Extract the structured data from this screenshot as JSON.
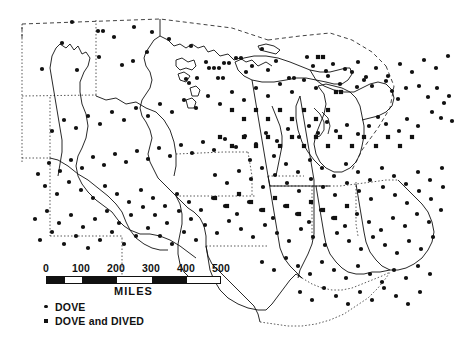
{
  "figure": {
    "background_color": "#ffffff",
    "ink_color": "#111111"
  },
  "scale": {
    "unit_label": "MILES",
    "ticks": [
      "0",
      "100",
      "200",
      "300",
      "400",
      "500"
    ],
    "tick_values": [
      0,
      100,
      200,
      300,
      400,
      500
    ],
    "bar_segments": [
      {
        "from": 0,
        "to": 50,
        "fill": "black"
      },
      {
        "from": 50,
        "to": 100,
        "fill": "white"
      },
      {
        "from": 100,
        "to": 200,
        "fill": "black"
      },
      {
        "from": 200,
        "to": 300,
        "fill": "white"
      },
      {
        "from": 300,
        "to": 400,
        "fill": "black"
      },
      {
        "from": 400,
        "to": 500,
        "fill": "white"
      }
    ]
  },
  "legend": {
    "items": [
      {
        "marker": "circle-marker",
        "label": "DOVE"
      },
      {
        "marker": "square-marker",
        "label": "DOVE and DIVED"
      }
    ]
  },
  "chart_data": {
    "type": "scatter",
    "xlabel": "",
    "ylabel": "",
    "legend_position": "bottom-left",
    "grid": false,
    "series": [
      {
        "name": "DOVE",
        "marker": "circle",
        "color": "#111111",
        "count": 268,
        "points": [
          [
            72,
            22
          ],
          [
            98,
            31
          ],
          [
            103,
            31
          ],
          [
            134,
            27
          ],
          [
            147,
            52
          ],
          [
            114,
            37
          ],
          [
            152,
            32
          ],
          [
            62,
            43
          ],
          [
            42,
            69
          ],
          [
            77,
            70
          ],
          [
            99,
            57
          ],
          [
            122,
            65
          ],
          [
            133,
            61
          ],
          [
            169,
            39
          ],
          [
            191,
            46
          ],
          [
            206,
            62
          ],
          [
            186,
            79
          ],
          [
            189,
            83
          ],
          [
            197,
            78
          ],
          [
            209,
            68
          ],
          [
            214,
            68
          ],
          [
            219,
            68
          ],
          [
            224,
            63
          ],
          [
            229,
            63
          ],
          [
            218,
            78
          ],
          [
            223,
            78
          ],
          [
            236,
            58
          ],
          [
            241,
            58
          ],
          [
            252,
            66
          ],
          [
            246,
            72
          ],
          [
            262,
            49
          ],
          [
            268,
            70
          ],
          [
            276,
            61
          ],
          [
            289,
            78
          ],
          [
            294,
            78
          ],
          [
            307,
            57
          ],
          [
            313,
            66
          ],
          [
            326,
            71
          ],
          [
            333,
            64
          ],
          [
            345,
            69
          ],
          [
            358,
            62
          ],
          [
            366,
            77
          ],
          [
            357,
            87
          ],
          [
            372,
            86
          ],
          [
            386,
            81
          ],
          [
            392,
            91
          ],
          [
            398,
            99
          ],
          [
            406,
            88
          ],
          [
            419,
            86
          ],
          [
            428,
            97
          ],
          [
            437,
            88
          ],
          [
            444,
            103
          ],
          [
            449,
            96
          ],
          [
            432,
            112
          ],
          [
            441,
            118
          ],
          [
            452,
            121
          ],
          [
            418,
            126
          ],
          [
            407,
            119
          ],
          [
            399,
            131
          ],
          [
            386,
            124
          ],
          [
            378,
            117
          ],
          [
            369,
            126
          ],
          [
            358,
            134
          ],
          [
            347,
            125
          ],
          [
            336,
            131
          ],
          [
            327,
            122
          ],
          [
            318,
            133
          ],
          [
            309,
            126
          ],
          [
            299,
            137
          ],
          [
            288,
            129
          ],
          [
            277,
            141
          ],
          [
            266,
            133
          ],
          [
            256,
            144
          ],
          [
            245,
            136
          ],
          [
            236,
            147
          ],
          [
            225,
            139
          ],
          [
            214,
            150
          ],
          [
            203,
            142
          ],
          [
            192,
            153
          ],
          [
            181,
            145
          ],
          [
            170,
            156
          ],
          [
            159,
            148
          ],
          [
            148,
            159
          ],
          [
            137,
            151
          ],
          [
            126,
            162
          ],
          [
            115,
            154
          ],
          [
            104,
            165
          ],
          [
            93,
            157
          ],
          [
            82,
            168
          ],
          [
            71,
            160
          ],
          [
            60,
            171
          ],
          [
            49,
            163
          ],
          [
            38,
            174
          ],
          [
            52,
            131
          ],
          [
            64,
            120
          ],
          [
            76,
            128
          ],
          [
            88,
            116
          ],
          [
            100,
            124
          ],
          [
            112,
            112
          ],
          [
            124,
            120
          ],
          [
            136,
            108
          ],
          [
            148,
            116
          ],
          [
            160,
            104
          ],
          [
            172,
            112
          ],
          [
            184,
            100
          ],
          [
            196,
            108
          ],
          [
            208,
            96
          ],
          [
            220,
            104
          ],
          [
            232,
            92
          ],
          [
            244,
            100
          ],
          [
            256,
            88
          ],
          [
            268,
            96
          ],
          [
            280,
            84
          ],
          [
            292,
            92
          ],
          [
            304,
            80
          ],
          [
            316,
            88
          ],
          [
            328,
            76
          ],
          [
            340,
            84
          ],
          [
            352,
            72
          ],
          [
            364,
            80
          ],
          [
            376,
            68
          ],
          [
            388,
            76
          ],
          [
            400,
            64
          ],
          [
            412,
            72
          ],
          [
            424,
            60
          ],
          [
            436,
            68
          ],
          [
            448,
            56
          ],
          [
            45,
            186
          ],
          [
            57,
            194
          ],
          [
            69,
            182
          ],
          [
            81,
            190
          ],
          [
            93,
            198
          ],
          [
            105,
            186
          ],
          [
            117,
            194
          ],
          [
            129,
            202
          ],
          [
            141,
            190
          ],
          [
            153,
            198
          ],
          [
            165,
            206
          ],
          [
            177,
            194
          ],
          [
            189,
            202
          ],
          [
            201,
            210
          ],
          [
            213,
            198
          ],
          [
            225,
            206
          ],
          [
            237,
            214
          ],
          [
            249,
            202
          ],
          [
            261,
            210
          ],
          [
            273,
            218
          ],
          [
            285,
            206
          ],
          [
            297,
            214
          ],
          [
            309,
            222
          ],
          [
            321,
            210
          ],
          [
            333,
            218
          ],
          [
            345,
            226
          ],
          [
            357,
            214
          ],
          [
            369,
            222
          ],
          [
            381,
            230
          ],
          [
            393,
            218
          ],
          [
            405,
            226
          ],
          [
            417,
            214
          ],
          [
            429,
            222
          ],
          [
            441,
            210
          ],
          [
            250,
            160
          ],
          [
            262,
            168
          ],
          [
            274,
            156
          ],
          [
            286,
            164
          ],
          [
            298,
            172
          ],
          [
            310,
            160
          ],
          [
            322,
            168
          ],
          [
            334,
            176
          ],
          [
            346,
            164
          ],
          [
            358,
            172
          ],
          [
            370,
            180
          ],
          [
            382,
            168
          ],
          [
            394,
            176
          ],
          [
            406,
            184
          ],
          [
            418,
            172
          ],
          [
            430,
            180
          ],
          [
            442,
            168
          ],
          [
            215,
            175
          ],
          [
            227,
            183
          ],
          [
            239,
            171
          ],
          [
            251,
            179
          ],
          [
            263,
            187
          ],
          [
            275,
            175
          ],
          [
            287,
            183
          ],
          [
            299,
            191
          ],
          [
            311,
            179
          ],
          [
            323,
            187
          ],
          [
            335,
            195
          ],
          [
            347,
            183
          ],
          [
            359,
            191
          ],
          [
            371,
            199
          ],
          [
            383,
            187
          ],
          [
            395,
            195
          ],
          [
            407,
            203
          ],
          [
            419,
            191
          ],
          [
            431,
            199
          ],
          [
            443,
            187
          ],
          [
            205,
            225
          ],
          [
            217,
            233
          ],
          [
            229,
            221
          ],
          [
            241,
            229
          ],
          [
            253,
            237
          ],
          [
            265,
            225
          ],
          [
            277,
            233
          ],
          [
            289,
            241
          ],
          [
            301,
            229
          ],
          [
            313,
            237
          ],
          [
            325,
            245
          ],
          [
            337,
            233
          ],
          [
            349,
            241
          ],
          [
            361,
            249
          ],
          [
            373,
            237
          ],
          [
            385,
            245
          ],
          [
            397,
            253
          ],
          [
            409,
            241
          ],
          [
            421,
            249
          ],
          [
            433,
            237
          ],
          [
            262,
            262
          ],
          [
            274,
            270
          ],
          [
            286,
            258
          ],
          [
            298,
            266
          ],
          [
            310,
            274
          ],
          [
            322,
            262
          ],
          [
            334,
            270
          ],
          [
            346,
            278
          ],
          [
            358,
            266
          ],
          [
            370,
            274
          ],
          [
            382,
            282
          ],
          [
            394,
            270
          ],
          [
            406,
            278
          ],
          [
            418,
            266
          ],
          [
            430,
            274
          ],
          [
            300,
            292
          ],
          [
            312,
            300
          ],
          [
            324,
            288
          ],
          [
            336,
            296
          ],
          [
            348,
            304
          ],
          [
            360,
            292
          ],
          [
            372,
            300
          ],
          [
            384,
            288
          ],
          [
            396,
            296
          ],
          [
            408,
            304
          ],
          [
            420,
            292
          ],
          [
            155,
            215
          ],
          [
            167,
            223
          ],
          [
            179,
            211
          ],
          [
            191,
            219
          ],
          [
            143,
            207
          ],
          [
            131,
            215
          ],
          [
            119,
            223
          ],
          [
            107,
            211
          ],
          [
            95,
            219
          ],
          [
            83,
            227
          ],
          [
            71,
            215
          ],
          [
            59,
            223
          ],
          [
            47,
            211
          ],
          [
            35,
            219
          ],
          [
            160,
            236
          ],
          [
            172,
            244
          ],
          [
            184,
            232
          ],
          [
            196,
            240
          ],
          [
            148,
            228
          ],
          [
            136,
            236
          ],
          [
            124,
            244
          ],
          [
            112,
            232
          ],
          [
            100,
            240
          ],
          [
            88,
            248
          ],
          [
            76,
            236
          ],
          [
            64,
            244
          ],
          [
            52,
            232
          ],
          [
            40,
            240
          ]
        ]
      },
      {
        "name": "DOVE and DIVED",
        "marker": "square",
        "color": "#111111",
        "count": 42,
        "points": [
          [
            318,
            57
          ],
          [
            323,
            57
          ],
          [
            336,
            92
          ],
          [
            341,
            92
          ],
          [
            328,
            110
          ],
          [
            316,
            119
          ],
          [
            304,
            110
          ],
          [
            292,
            119
          ],
          [
            280,
            110
          ],
          [
            268,
            119
          ],
          [
            256,
            110
          ],
          [
            244,
            119
          ],
          [
            232,
            110
          ],
          [
            220,
            137
          ],
          [
            232,
            146
          ],
          [
            244,
            137
          ],
          [
            256,
            146
          ],
          [
            268,
            137
          ],
          [
            280,
            146
          ],
          [
            292,
            137
          ],
          [
            304,
            146
          ],
          [
            316,
            137
          ],
          [
            328,
            146
          ],
          [
            340,
            137
          ],
          [
            352,
            146
          ],
          [
            364,
            137
          ],
          [
            376,
            146
          ],
          [
            388,
            137
          ],
          [
            400,
            146
          ],
          [
            412,
            137
          ],
          [
            215,
            198
          ],
          [
            227,
            206
          ],
          [
            239,
            194
          ],
          [
            251,
            202
          ],
          [
            263,
            210
          ],
          [
            275,
            198
          ],
          [
            287,
            206
          ],
          [
            299,
            214
          ],
          [
            311,
            202
          ],
          [
            323,
            210
          ],
          [
            335,
            218
          ],
          [
            347,
            206
          ]
        ]
      }
    ]
  }
}
